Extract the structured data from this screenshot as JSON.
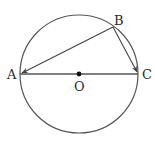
{
  "diagram": {
    "type": "geometry",
    "colors": {
      "stroke": "#555555",
      "text": "#2a2a2a",
      "background": "#ffffff"
    },
    "circle": {
      "cx": 79,
      "cy": 74,
      "r": 59
    },
    "points": {
      "A": {
        "label": "A",
        "x": 20,
        "y": 74
      },
      "B": {
        "label": "B",
        "x": 113,
        "y": 27
      },
      "C": {
        "label": "C",
        "x": 138,
        "y": 74
      },
      "O": {
        "label": "O",
        "x": 79,
        "y": 74
      }
    },
    "segments": [
      {
        "from": "A",
        "to": "C",
        "arrow": false
      },
      {
        "from": "B",
        "to": "A",
        "arrow": true
      },
      {
        "from": "B",
        "to": "C",
        "arrow": true
      }
    ]
  }
}
